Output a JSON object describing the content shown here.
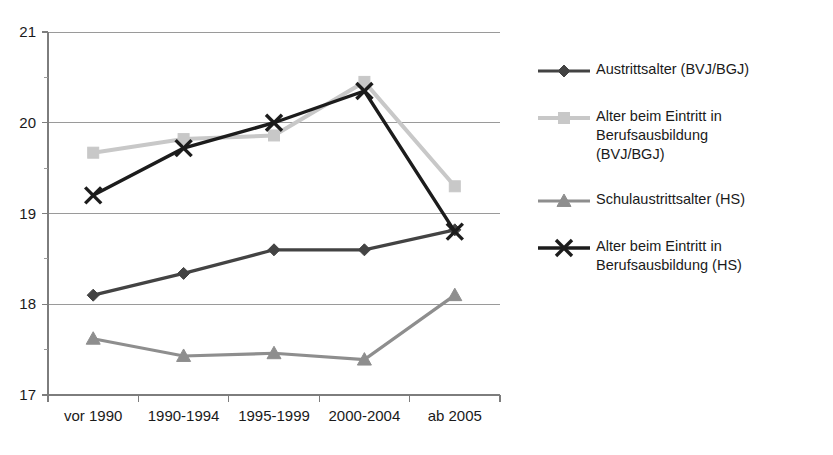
{
  "chart_data": {
    "type": "line",
    "title": "",
    "xlabel": "",
    "ylabel": "",
    "ylim": [
      17,
      21
    ],
    "yticks": [
      "17",
      "18",
      "19",
      "20",
      "21"
    ],
    "ytick_values": [
      17,
      18,
      19,
      20,
      21
    ],
    "minor_ticks": true,
    "grid": "horizontal",
    "legend_position": "right",
    "categories": [
      "vor 1990",
      "1990-1994",
      "1995-1999",
      "2000-2004",
      "ab 2005"
    ],
    "series": [
      {
        "name": "Austrittsalter (BVJ/BGJ)",
        "legend_label": "Austrittsalter (BVJ/BGJ)",
        "marker": "diamond",
        "color": "#434343",
        "stroke_width": 3.2,
        "values": [
          18.1,
          18.34,
          18.6,
          18.6,
          18.82
        ]
      },
      {
        "name": "Alter beim Eintritt in Berufsausbildung (BVJ/BGJ)",
        "legend_label": "Alter beim Eintritt in\nBerufsausbildung\n(BVJ/BGJ)",
        "marker": "square",
        "color": "#c8c8c8",
        "stroke_width": 4.0,
        "values": [
          19.67,
          19.82,
          19.86,
          20.45,
          19.3
        ]
      },
      {
        "name": "Schulaustrittsalter (HS)",
        "legend_label": "Schulaustrittsalter (HS)",
        "marker": "triangle",
        "color": "#8e8e8e",
        "stroke_width": 3.2,
        "values": [
          17.62,
          17.43,
          17.46,
          17.39,
          18.1
        ]
      },
      {
        "name": "Alter beim Eintritt in Berufsausbildung (HS)",
        "legend_label": "Alter beim Eintritt in\nBerufsausbildung (HS)",
        "marker": "cross-x",
        "color": "#1c1c1c",
        "stroke_width": 3.4,
        "values": [
          19.2,
          19.72,
          20.0,
          20.35,
          18.8
        ]
      }
    ]
  }
}
